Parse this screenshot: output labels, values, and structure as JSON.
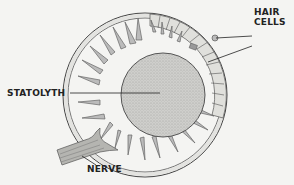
{
  "diagram": {
    "labels": {
      "statolyth": "STATOLYTH",
      "hair_cells_line1": "HAIR",
      "hair_cells_line2": "CELLS",
      "nerve": "NERVE"
    },
    "colors": {
      "background": "#f4f4f2",
      "ink": "#333333",
      "statolyth_fill": "#c9c9c6",
      "wall_fill": "#dcdcd8"
    }
  }
}
